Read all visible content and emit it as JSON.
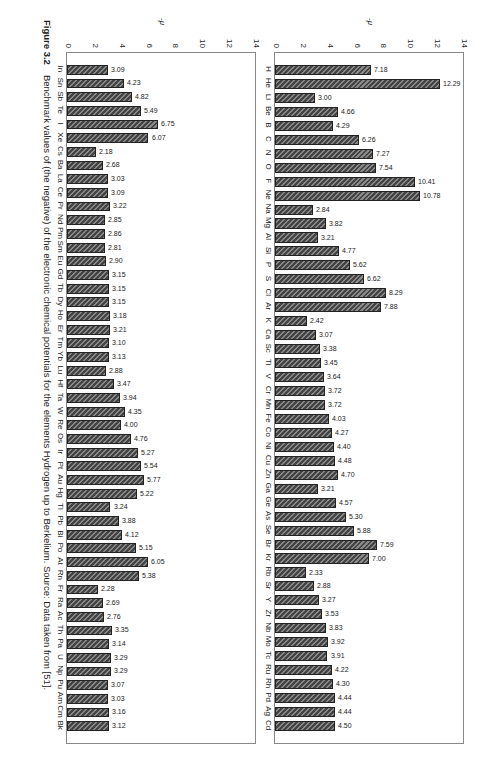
{
  "caption": {
    "label": "Figure 3.2",
    "text": "Benchmark values of (the negative) of the electronic chemical potentials for the elements Hydrogen up to Berkelium. Source: Data taken from [51]."
  },
  "chart_data": [
    {
      "type": "bar",
      "title": "",
      "xlabel": "",
      "ylabel": "-μ",
      "ylim": [
        0,
        14
      ],
      "yticks": [
        0,
        2,
        4,
        6,
        8,
        10,
        12,
        14
      ],
      "grid": false,
      "categories": [
        "H",
        "He",
        "Li",
        "Be",
        "B",
        "C",
        "N",
        "O",
        "F",
        "Ne",
        "Na",
        "Mg",
        "Al",
        "Si",
        "P",
        "S",
        "Cl",
        "Ar",
        "K",
        "Ca",
        "Sc",
        "Ti",
        "V",
        "Cr",
        "Mn",
        "Fe",
        "Co",
        "Ni",
        "Cu",
        "Zn",
        "Ga",
        "Ge",
        "As",
        "Se",
        "Br",
        "Kr",
        "Rb",
        "Sr",
        "Y",
        "Zr",
        "Nb",
        "Mo",
        "Tc",
        "Ru",
        "Rh",
        "Pd",
        "Ag",
        "Cd"
      ],
      "values": [
        7.18,
        12.29,
        3.0,
        4.66,
        4.29,
        6.26,
        7.27,
        7.54,
        10.41,
        10.78,
        2.84,
        3.82,
        3.21,
        4.77,
        5.62,
        6.62,
        8.29,
        7.88,
        2.42,
        3.07,
        3.38,
        3.45,
        3.64,
        3.72,
        3.72,
        4.03,
        4.27,
        4.4,
        4.48,
        4.7,
        3.21,
        4.57,
        5.3,
        5.88,
        7.59,
        7.0,
        2.33,
        2.88,
        3.27,
        3.53,
        3.83,
        3.92,
        3.91,
        4.22,
        4.3,
        4.44,
        4.44,
        4.5
      ],
      "labels": [
        "7.18",
        "12.29",
        "3.00",
        "4.66",
        "4.29",
        "6.26",
        "7.27",
        "7.54",
        "10.41",
        "10.78",
        "2.84",
        "3.82",
        "3.21",
        "4.77",
        "5.62",
        "6.62",
        "8.29",
        "7.88",
        "2.42",
        "3.07",
        "3.38",
        "3.45",
        "3.64",
        "3.72",
        "3.72",
        "4.03",
        "4.27",
        "4.40",
        "4.48",
        "4.70",
        "3.21",
        "4.57",
        "5.30",
        "5.88",
        "7.59",
        "7.00",
        "2.33",
        "2.88",
        "3.27",
        "3.53",
        "3.83",
        "3.92",
        "3.91",
        "4.22",
        "4.30",
        "4.44",
        "4.44",
        "4.50"
      ]
    },
    {
      "type": "bar",
      "title": "",
      "xlabel": "",
      "ylabel": "-μ",
      "ylim": [
        0,
        14
      ],
      "yticks": [
        0,
        2,
        4,
        6,
        8,
        10,
        12,
        14
      ],
      "grid": false,
      "categories": [
        "In",
        "Sn",
        "Sb",
        "Te",
        "I",
        "Xe",
        "Cs",
        "Ba",
        "La",
        "Ce",
        "Pr",
        "Nd",
        "Pm",
        "Sm",
        "Eu",
        "Gd",
        "Tb",
        "Dy",
        "Ho",
        "Er",
        "Tm",
        "Yb",
        "Lu",
        "Hf",
        "Ta",
        "W",
        "Re",
        "Os",
        "Ir",
        "Pt",
        "Au",
        "Hg",
        "Tl",
        "Pb",
        "Bi",
        "Po",
        "At",
        "Rn",
        "Fr",
        "Ra",
        "Ac",
        "Th",
        "Pa",
        "U",
        "Np",
        "Pu",
        "Am",
        "Cm",
        "Bk"
      ],
      "values": [
        3.09,
        4.23,
        4.82,
        5.49,
        6.75,
        6.07,
        2.18,
        2.68,
        3.03,
        3.09,
        3.22,
        2.85,
        2.86,
        2.81,
        2.9,
        3.15,
        3.15,
        3.15,
        3.18,
        3.21,
        3.1,
        3.13,
        2.88,
        3.47,
        3.94,
        4.35,
        4.0,
        4.76,
        5.27,
        5.54,
        5.77,
        5.22,
        3.24,
        3.88,
        4.12,
        5.15,
        6.05,
        5.38,
        2.28,
        2.69,
        2.76,
        3.35,
        3.14,
        3.29,
        3.29,
        3.07,
        3.03,
        3.16,
        3.12
      ],
      "labels": [
        "3.09",
        "4.23",
        "4.82",
        "5.49",
        "6.75",
        "6.07",
        "2.18",
        "2.68",
        "3.03",
        "3.09",
        "3.22",
        "2.85",
        "2.86",
        "2.81",
        "2.90",
        "3.15",
        "3.15",
        "3.15",
        "3.18",
        "3.21",
        "3.10",
        "3.13",
        "2.88",
        "3.47",
        "3.94",
        "4.35",
        "4.00",
        "4.76",
        "5.27",
        "5.54",
        "5.77",
        "5.22",
        "3.24",
        "3.88",
        "4.12",
        "5.15",
        "6.05",
        "5.38",
        "2.28",
        "2.69",
        "2.76",
        "3.35",
        "3.14",
        "3.29",
        "3.29",
        "3.07",
        "3.03",
        "3.16",
        "3.12"
      ]
    }
  ]
}
